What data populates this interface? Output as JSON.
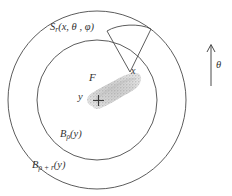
{
  "figure": {
    "background_color": "#ffffff",
    "stroke_color": "#4a4a4a",
    "text_color": "#333333",
    "blob_fill_color": "#cfcfcf"
  },
  "labels": {
    "outer_ball": {
      "base": "B",
      "subscript": "ρ + r",
      "argument": "(y)",
      "full": "Bρ+r(y)"
    },
    "inner_ball": {
      "base": "B",
      "subscript": "ρ",
      "argument": "(y)",
      "full": "Bρ(y)"
    },
    "cone": {
      "base": "S",
      "subscript": "r",
      "argument": "(x, θ , φ)",
      "full": "Sr(x, θ , φ)"
    },
    "set_f": "F",
    "point_y": "y",
    "point_x": "x",
    "direction_theta": "θ",
    "center_marker": "+"
  },
  "geometry": {
    "center": {
      "x": 97,
      "y": 100
    },
    "outer_radius": 89,
    "inner_radius": 60,
    "cone_apex": {
      "x": 130,
      "y": 72
    },
    "theta_arrow": {
      "x": 211,
      "y_top": 45,
      "y_bottom": 86
    }
  }
}
